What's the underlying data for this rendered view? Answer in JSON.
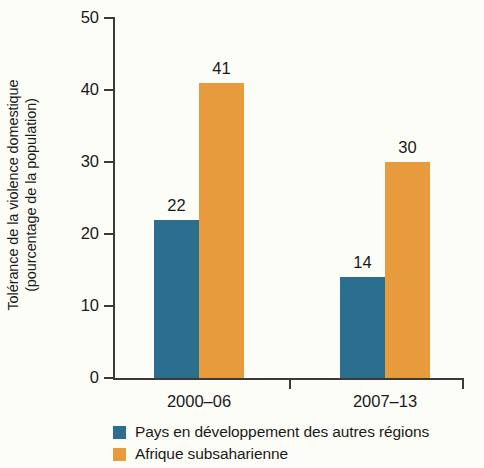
{
  "chart_data": {
    "type": "bar",
    "title": "",
    "xlabel": "",
    "ylabel": "Tolérance de la violence domestique (pourcentage de la population)",
    "ylabel_lines": [
      "Tolérance de la violence domestique",
      "(pourcentage de la population)"
    ],
    "categories": [
      "2000–06",
      "2007–13"
    ],
    "ylim": [
      0,
      50
    ],
    "yticks": [
      0,
      10,
      20,
      30,
      40,
      50
    ],
    "ytick_labels": [
      "0",
      "10",
      "20",
      "30",
      "40",
      "50"
    ],
    "grid": false,
    "legend_position": "bottom-left",
    "series": [
      {
        "name": "Pays en développement des autres régions",
        "color": "#2c6e8e",
        "values": [
          22,
          14
        ],
        "value_labels": [
          "22",
          "14"
        ]
      },
      {
        "name": "Afrique subsaharienne",
        "color": "#e89b3c",
        "values": [
          41,
          30
        ],
        "value_labels": [
          "41",
          "30"
        ]
      }
    ]
  },
  "colors": {
    "background": "#fdfdf7",
    "axis": "#3a3a3a",
    "text": "#1a1a1a",
    "series_blue": "#2c6e8e",
    "series_orange": "#e89b3c"
  }
}
